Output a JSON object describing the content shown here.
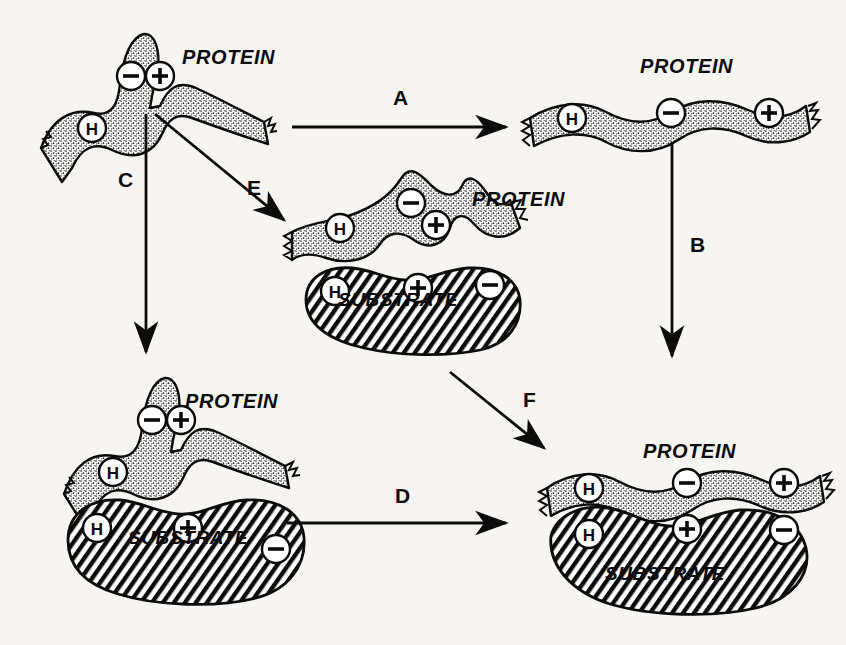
{
  "figure": {
    "background_color": "#f6f5f2",
    "ink_color": "#0b0b0b",
    "protein_fill_color": "#d8d5cf",
    "substrate_fill_color": "#ffffff"
  },
  "labels": {
    "protein": "PROTEIN",
    "substrate": "SUBSTRATE",
    "charge_negative": "−",
    "charge_positive": "+",
    "hydrogen": "H"
  },
  "nodes": [
    {
      "id": "native-protein",
      "kind": "protein",
      "state": "folded-native",
      "title": "PROTEIN",
      "groups": [
        "H",
        "−",
        "+"
      ],
      "has_substrate": false
    },
    {
      "id": "denatured-protein",
      "kind": "protein",
      "state": "unfolded-extended",
      "title": "PROTEIN",
      "groups": [
        "H",
        "−",
        "+"
      ],
      "has_substrate": false
    },
    {
      "id": "protein-substrate-partial",
      "kind": "protein-substrate",
      "state": "folded-with-substrate",
      "title": "PROTEIN",
      "substrate_title": "SUBSTRATE",
      "protein_groups": [
        "H",
        "−",
        "+"
      ],
      "substrate_groups": [
        "H",
        "+",
        "−"
      ],
      "has_substrate": true
    },
    {
      "id": "protein-substrate-bound",
      "kind": "protein-substrate",
      "state": "folded-bound-substrate",
      "title": "PROTEIN",
      "substrate_title": "SUBSTRATE",
      "protein_groups": [
        "H",
        "−",
        "+"
      ],
      "substrate_groups": [
        "H",
        "+",
        "−"
      ],
      "has_substrate": true
    },
    {
      "id": "complex-final",
      "kind": "protein-substrate",
      "state": "unfolded-complexed",
      "title": "PROTEIN",
      "substrate_title": "SUBSTRATE",
      "protein_groups": [
        "H",
        "−",
        "+"
      ],
      "substrate_groups": [
        "H",
        "+",
        "−"
      ],
      "has_substrate": true
    }
  ],
  "arrows": [
    {
      "id": "arrow-a",
      "label": "A",
      "from": "native-protein",
      "to": "denatured-protein",
      "direction": "right"
    },
    {
      "id": "arrow-b",
      "label": "B",
      "from": "denatured-protein",
      "to": "complex-final",
      "direction": "down"
    },
    {
      "id": "arrow-c",
      "label": "C",
      "from": "native-protein",
      "to": "protein-substrate-bound",
      "direction": "down"
    },
    {
      "id": "arrow-d",
      "label": "D",
      "from": "protein-substrate-bound",
      "to": "complex-final",
      "direction": "right"
    },
    {
      "id": "arrow-e",
      "label": "E",
      "from": "native-protein",
      "to": "protein-substrate-partial",
      "direction": "down-right"
    },
    {
      "id": "arrow-f",
      "label": "F",
      "from": "protein-substrate-partial",
      "to": "complex-final",
      "direction": "down-right"
    }
  ],
  "text_positions": {
    "protein_top_left": {
      "text": "PROTEIN",
      "x": 182,
      "y": 56
    },
    "protein_top_right": {
      "text": "PROTEIN",
      "x": 640,
      "y": 65
    },
    "protein_mid": {
      "text": "PROTEIN",
      "x": 472,
      "y": 198
    },
    "substrate_mid": {
      "text": "SUBSTRATE",
      "x": 338,
      "y": 300
    },
    "protein_bot_left": {
      "text": "PROTEIN",
      "x": 185,
      "y": 400
    },
    "substrate_bot_left": {
      "text": "SUBSTRATE",
      "x": 128,
      "y": 538
    },
    "protein_bot_right": {
      "text": "PROTEIN",
      "x": 643,
      "y": 450
    },
    "substrate_bot_right": {
      "text": "SUBSTRATE",
      "x": 605,
      "y": 574
    },
    "arrow_a": {
      "text": "A",
      "x": 393,
      "y": 98
    },
    "arrow_b": {
      "text": "B",
      "x": 690,
      "y": 245
    },
    "arrow_c": {
      "text": "C",
      "x": 118,
      "y": 180
    },
    "arrow_d": {
      "text": "D",
      "x": 395,
      "y": 496
    },
    "arrow_e": {
      "text": "E",
      "x": 247,
      "y": 188
    },
    "arrow_f": {
      "text": "F",
      "x": 523,
      "y": 400
    }
  }
}
